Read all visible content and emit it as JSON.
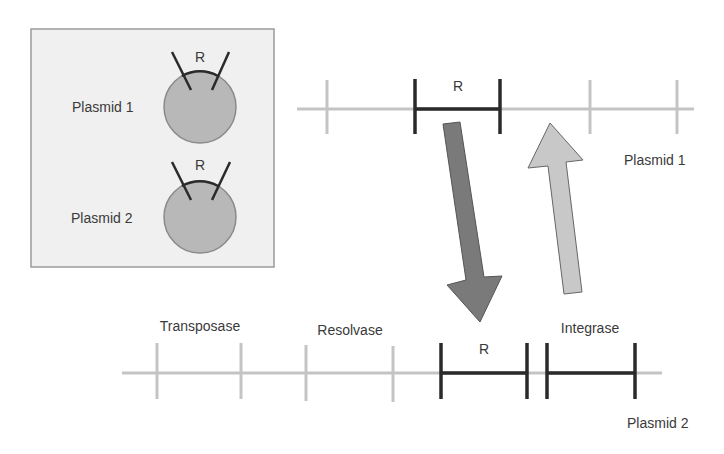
{
  "inset": {
    "plasmid1_label": "Plasmid 1",
    "plasmid2_label": "Plasmid 2",
    "r_label_1": "R",
    "r_label_2": "R"
  },
  "plasmid1_map": {
    "label": "Plasmid 1",
    "segment_label": "R"
  },
  "plasmid2_map": {
    "label": "Plasmid 2",
    "genes": [
      "Transposase",
      "Resolvase",
      "R",
      "Integrase"
    ]
  },
  "colors": {
    "light_line": "#c4c4c4",
    "dark_line": "#2a2a2a",
    "circle_fill": "#b8b8b8",
    "down_arrow": "#7a7a7a",
    "up_arrow": "#c8c8c8",
    "inset_bg": "#f0f0f0"
  }
}
